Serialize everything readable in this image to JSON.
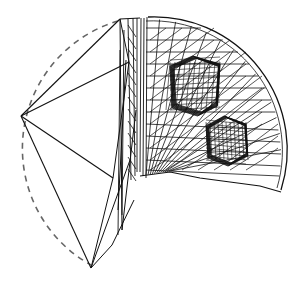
{
  "figure": {
    "colors": {
      "background": "#ffffff",
      "line": "#111111",
      "dashed": "#666666"
    },
    "sphere": {
      "cx": 150,
      "cy": 150,
      "r": 133
    },
    "coarse_vertices": {
      "left": [
        21,
        116
      ],
      "top": [
        120,
        19
      ],
      "bottom": [
        91,
        268
      ],
      "inner_top": [
        129,
        62
      ],
      "inner_mid": [
        113,
        178
      ],
      "spine_top": [
        140,
        18
      ],
      "spine_bottom": [
        137,
        175
      ]
    },
    "inclusions": [
      {
        "name": "upper-cube",
        "center": [
          195,
          85
        ],
        "size": 50
      },
      {
        "name": "lower-cube",
        "center": [
          226,
          140
        ],
        "size": 40
      }
    ]
  }
}
